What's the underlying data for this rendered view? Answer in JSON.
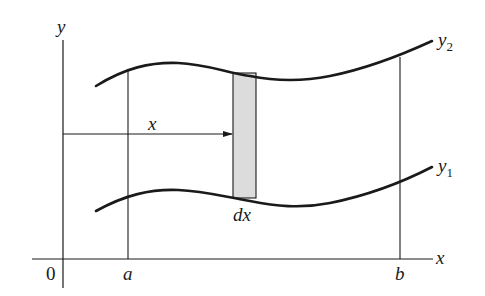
{
  "figure": {
    "colors": {
      "ink": "#1a1a1a",
      "strip_fill": "#dcdcdc",
      "background": "#ffffff"
    }
  },
  "axes": {
    "y_label": "y",
    "x_label": "x",
    "origin_label": "0"
  },
  "bounds": {
    "a_label": "a",
    "b_label": "b"
  },
  "curves": {
    "upper": {
      "name": "y",
      "subscript": "2"
    },
    "lower": {
      "name": "y",
      "subscript": "1"
    }
  },
  "strip": {
    "width_label": "dx",
    "distance_label": "x"
  }
}
